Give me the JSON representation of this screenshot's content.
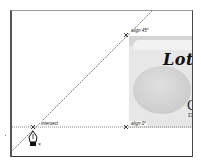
{
  "canvas": {
    "artboard_border_color": "#444444",
    "guide_color": "#333333"
  },
  "placed_image": {
    "headline": "Lots",
    "brand_letter": "C",
    "brand_sub": "D"
  },
  "smart_guides": {
    "align_45_label": "align 45°",
    "align_0_label": "align 0°",
    "intersect_label": "intersect"
  },
  "cursor": {
    "tool": "pen-tool",
    "modifier": "×"
  }
}
